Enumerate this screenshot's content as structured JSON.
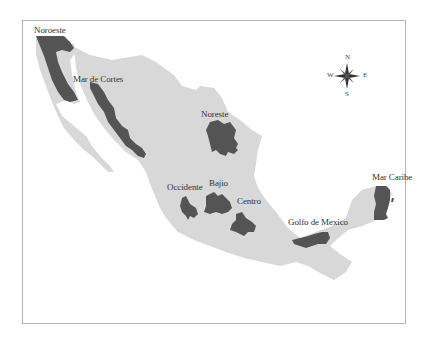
{
  "map": {
    "colors": {
      "country_fill": "#d8d8d8",
      "region_fill": "#545454",
      "frame_border": "#b5b5b5",
      "label_color": "#333333"
    },
    "regions": [
      {
        "id": "noroeste",
        "label": "Noroeste"
      },
      {
        "id": "mar-de-cortes",
        "label": "Mar de Cortes"
      },
      {
        "id": "noreste",
        "label": "Noreste"
      },
      {
        "id": "occidente",
        "label": "Occidente"
      },
      {
        "id": "bajio",
        "label": "Bajio"
      },
      {
        "id": "centro",
        "label": "Centro"
      },
      {
        "id": "golfo-de-mexico",
        "label": "Golfo de Mexico"
      },
      {
        "id": "mar-caribe",
        "label": "Mar Caribe"
      }
    ],
    "compass": {
      "icon": "compass-rose-icon",
      "north": "N",
      "south": "S",
      "east": "E",
      "west": "W"
    }
  }
}
